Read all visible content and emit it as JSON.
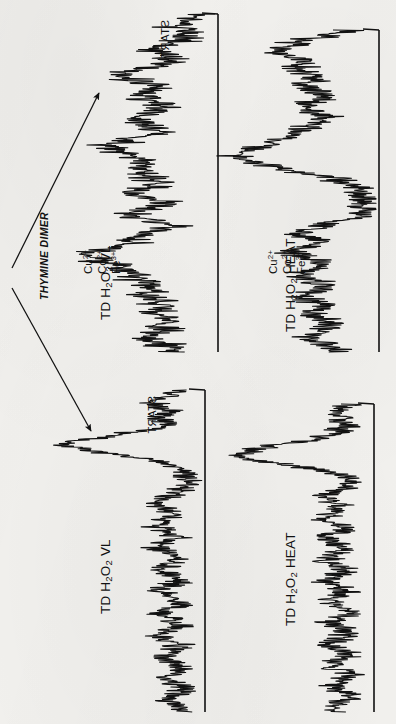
{
  "figure": {
    "kind": "densitometer-chromatogram-figure",
    "orientation_note": "panels rotated 90 degrees",
    "background_color": "#f2f1ee",
    "ink_color": "#111111"
  },
  "annotations": {
    "thymine_dimer_label": "THYMINE DIMER",
    "start_label_top": "START",
    "start_label_bottom": "START",
    "arrow_count": 2
  },
  "panels": [
    {
      "id": "panel-top-left",
      "label_main": "TD  H",
      "label_sub1": "2",
      "label_mid": "O",
      "label_sub2": "2",
      "label_tail": "  VL",
      "label_plain": "TD H2O2 VL Cu2+ Co2+ Fe3+",
      "ions": [
        "Cu2+",
        "Co2+",
        "Fe3+"
      ],
      "has_ions": true,
      "has_start": true
    },
    {
      "id": "panel-top-right",
      "label_main": "TD  H",
      "label_sub1": "2",
      "label_mid": "O",
      "label_sub2": "2",
      "label_tail": "  HEAT",
      "label_plain": "TD H2O2 HEAT Cu2+ Co2+ Fe3+",
      "ions": [
        "Cu2+",
        "Co2+",
        "Fe3+"
      ],
      "has_ions": true,
      "has_start": false
    },
    {
      "id": "panel-bottom-left",
      "label_main": "TD  H",
      "label_sub1": "2",
      "label_mid": "O",
      "label_sub2": "2",
      "label_tail": "  VL",
      "label_plain": "TD H2O2 VL",
      "ions": [],
      "has_ions": false,
      "has_start": true
    },
    {
      "id": "panel-bottom-right",
      "label_main": "TD  H",
      "label_sub1": "2",
      "label_mid": "O",
      "label_sub2": "2",
      "label_tail": "  HEAT",
      "label_plain": "TD H2O2 HEAT",
      "ions": [],
      "has_ions": false,
      "has_start": false
    }
  ],
  "chart_data": {
    "type": "line",
    "xlabel": "Migration distance (arbitrary units, START at top)",
    "ylabel": "Radioactivity / absorbance (arbitrary units)",
    "grid": false,
    "legend_position": "none",
    "note": "Four independent traces; each trace is drawn rotated 90 degrees so the migration axis runs vertically and signal deflects to the left of its baseline.",
    "series": [
      {
        "name": "TD H2O2 VL Cu2+ Co2+ Fe3+",
        "panel": "panel-top-left",
        "baseline_x": 218,
        "axis_range_y": [
          14,
          352
        ],
        "peaks": [
          {
            "position": 0.06,
            "height": 0.3,
            "label": "START shoulder"
          },
          {
            "position": 0.18,
            "height": 0.62,
            "label": "thymine dimer"
          },
          {
            "position": 0.34,
            "height": 0.74,
            "label": ""
          },
          {
            "position": 0.5,
            "height": 0.55,
            "label": ""
          },
          {
            "position": 0.68,
            "height": 0.88,
            "label": ""
          },
          {
            "position": 0.84,
            "height": 0.48,
            "label": ""
          }
        ],
        "noise_amplitude": 0.14,
        "values": [
          0.1,
          0.22,
          0.31,
          0.25,
          0.18,
          0.3,
          0.44,
          0.38,
          0.29,
          0.4,
          0.58,
          0.62,
          0.5,
          0.41,
          0.52,
          0.47,
          0.36,
          0.44,
          0.55,
          0.49,
          0.38,
          0.46,
          0.6,
          0.74,
          0.66,
          0.52,
          0.44,
          0.57,
          0.5,
          0.4,
          0.47,
          0.55,
          0.43,
          0.36,
          0.48,
          0.55,
          0.42,
          0.33,
          0.45,
          0.52,
          0.6,
          0.72,
          0.88,
          0.8,
          0.66,
          0.55,
          0.62,
          0.52,
          0.44,
          0.5,
          0.42,
          0.35,
          0.45,
          0.38,
          0.3,
          0.36,
          0.48,
          0.4,
          0.32,
          0.26
        ]
      },
      {
        "name": "TD H2O2 HEAT Cu2+ Co2+ Fe3+",
        "panel": "panel-top-right",
        "baseline_x": 379,
        "axis_range_y": [
          30,
          352
        ],
        "peaks": [
          {
            "position": 0.1,
            "height": 0.7,
            "label": ""
          },
          {
            "position": 0.26,
            "height": 0.52,
            "label": ""
          },
          {
            "position": 0.46,
            "height": 0.95,
            "label": "thymine dimer"
          },
          {
            "position": 0.68,
            "height": 0.56,
            "label": ""
          },
          {
            "position": 0.86,
            "height": 0.4,
            "label": ""
          }
        ],
        "noise_amplitude": 0.12,
        "values": [
          0.18,
          0.34,
          0.52,
          0.62,
          0.7,
          0.58,
          0.46,
          0.55,
          0.48,
          0.4,
          0.5,
          0.44,
          0.36,
          0.45,
          0.52,
          0.43,
          0.35,
          0.42,
          0.5,
          0.58,
          0.66,
          0.74,
          0.84,
          0.95,
          0.88,
          0.7,
          0.52,
          0.34,
          0.22,
          0.14,
          0.1,
          0.09,
          0.1,
          0.12,
          0.16,
          0.26,
          0.4,
          0.54,
          0.48,
          0.4,
          0.5,
          0.56,
          0.46,
          0.38,
          0.47,
          0.54,
          0.44,
          0.36,
          0.44,
          0.52,
          0.42,
          0.34,
          0.42,
          0.36,
          0.3,
          0.38,
          0.46,
          0.38,
          0.3,
          0.22
        ]
      },
      {
        "name": "TD H2O2 VL",
        "panel": "panel-bottom-left",
        "baseline_x": 205,
        "axis_range_y": [
          390,
          712
        ],
        "peaks": [
          {
            "position": 0.1,
            "height": 0.35,
            "label": "START shoulder"
          },
          {
            "position": 0.22,
            "height": 0.95,
            "label": "thymine dimer"
          },
          {
            "position": 0.55,
            "height": 0.3,
            "label": ""
          },
          {
            "position": 0.8,
            "height": 0.28,
            "label": ""
          }
        ],
        "noise_amplitude": 0.1,
        "values": [
          0.14,
          0.26,
          0.34,
          0.28,
          0.22,
          0.3,
          0.26,
          0.34,
          0.55,
          0.78,
          0.95,
          0.8,
          0.52,
          0.32,
          0.22,
          0.16,
          0.12,
          0.11,
          0.14,
          0.2,
          0.28,
          0.32,
          0.26,
          0.2,
          0.28,
          0.33,
          0.25,
          0.19,
          0.27,
          0.31,
          0.24,
          0.18,
          0.26,
          0.3,
          0.23,
          0.17,
          0.25,
          0.3,
          0.22,
          0.16,
          0.24,
          0.29,
          0.21,
          0.16,
          0.23,
          0.28,
          0.21,
          0.15,
          0.22,
          0.27,
          0.2,
          0.15,
          0.22,
          0.26,
          0.19,
          0.14,
          0.21,
          0.25,
          0.18,
          0.13
        ]
      },
      {
        "name": "TD H2O2 HEAT",
        "panel": "panel-bottom-right",
        "baseline_x": 374,
        "axis_range_y": [
          404,
          712
        ],
        "peaks": [
          {
            "position": 0.08,
            "height": 0.26,
            "label": ""
          },
          {
            "position": 0.24,
            "height": 0.92,
            "label": "thymine dimer"
          },
          {
            "position": 0.55,
            "height": 0.32,
            "label": ""
          },
          {
            "position": 0.82,
            "height": 0.3,
            "label": ""
          }
        ],
        "noise_amplitude": 0.1,
        "values": [
          0.12,
          0.22,
          0.28,
          0.24,
          0.18,
          0.24,
          0.3,
          0.44,
          0.66,
          0.84,
          0.92,
          0.78,
          0.5,
          0.3,
          0.2,
          0.15,
          0.2,
          0.28,
          0.34,
          0.27,
          0.21,
          0.29,
          0.34,
          0.26,
          0.2,
          0.28,
          0.33,
          0.25,
          0.19,
          0.27,
          0.32,
          0.24,
          0.18,
          0.26,
          0.31,
          0.23,
          0.18,
          0.26,
          0.3,
          0.22,
          0.17,
          0.25,
          0.3,
          0.22,
          0.17,
          0.24,
          0.29,
          0.22,
          0.16,
          0.24,
          0.28,
          0.21,
          0.16,
          0.23,
          0.28,
          0.2,
          0.15,
          0.22,
          0.27,
          0.2
        ]
      }
    ]
  }
}
